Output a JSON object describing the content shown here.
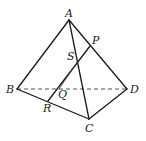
{
  "diagram": {
    "type": "tetrahedron",
    "points": {
      "A": {
        "label": "A",
        "x": 69,
        "y": 20
      },
      "B": {
        "label": "B",
        "x": 17,
        "y": 89
      },
      "C": {
        "label": "C",
        "x": 89,
        "y": 119
      },
      "D": {
        "label": "D",
        "x": 127,
        "y": 89
      },
      "P": {
        "label": "P",
        "x": 90,
        "y": 46
      },
      "S": {
        "label": "S",
        "x": 77,
        "y": 59
      },
      "Q": {
        "label": "Q",
        "x": 59,
        "y": 89
      },
      "R": {
        "label": "R",
        "x": 48,
        "y": 101
      }
    },
    "solid_edges": [
      "AB",
      "AC",
      "AD",
      "BC",
      "CD",
      "PR"
    ],
    "dashed_edges": [
      "BD"
    ],
    "thin_lines": [
      "SQ"
    ],
    "labels": {
      "A": "A",
      "B": "B",
      "C": "C",
      "D": "D",
      "P": "P",
      "S": "S",
      "Q": "Q",
      "R": "R"
    }
  }
}
